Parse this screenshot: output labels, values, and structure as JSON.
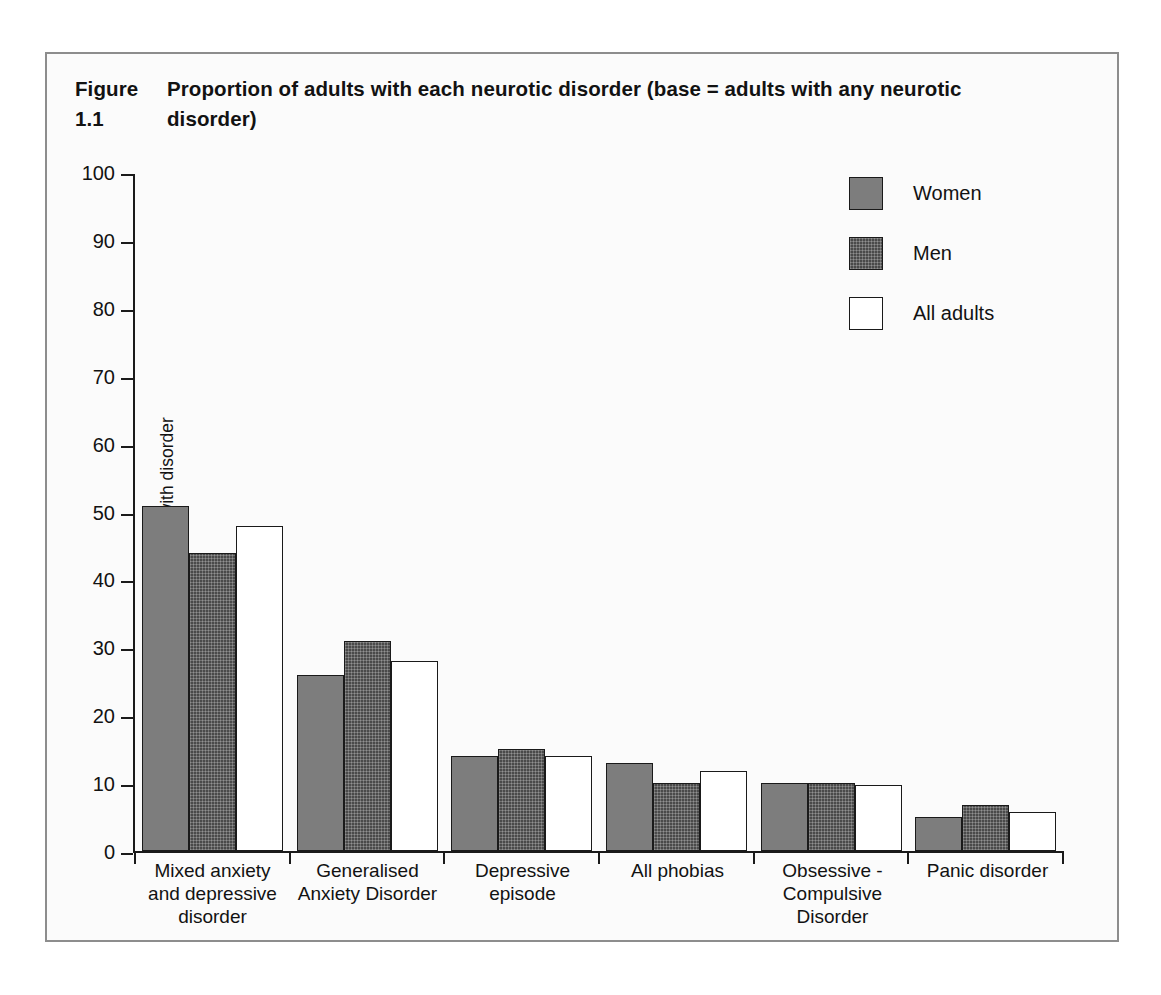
{
  "figure": {
    "number": "Figure 1.1",
    "caption": "Proportion of adults with each neurotic disorder (base = adults with any neurotic disorder)"
  },
  "legend": {
    "position": "top-right",
    "entries": [
      {
        "label": "Women",
        "swatch": "medium-grey-fill",
        "color": "#7d7d7d"
      },
      {
        "label": "Men",
        "swatch": "dark-grey-dotted-fill",
        "color": "#4a4a4a"
      },
      {
        "label": "All adults",
        "swatch": "white-fill",
        "color": "#ffffff"
      }
    ]
  },
  "axes": {
    "y_title": "Percentage with disorder",
    "y_ticks": [
      "100",
      "90",
      "80",
      "70",
      "60",
      "50",
      "40",
      "30",
      "20",
      "10",
      "0"
    ],
    "x_title": ""
  },
  "chart_data": {
    "type": "bar",
    "xlabel": "",
    "ylabel": "Percentage with disorder",
    "ylim": [
      0,
      100
    ],
    "ytick_step": 10,
    "grid": false,
    "legend_position": "top-right",
    "categories": [
      "Mixed anxiety and depressive disorder",
      "Generalised Anxiety Disorder",
      "Depressive episode",
      "All phobias",
      "Obsessive - Compulsive Disorder",
      "Panic disorder"
    ],
    "category_lines": [
      [
        "Mixed anxiety",
        "and depressive",
        "disorder"
      ],
      [
        "Generalised",
        "Anxiety Disorder"
      ],
      [
        "Depressive",
        "episode"
      ],
      [
        "All phobias"
      ],
      [
        "Obsessive -",
        "Compulsive",
        "Disorder"
      ],
      [
        "Panic disorder"
      ]
    ],
    "series": [
      {
        "name": "Women",
        "color": "#7d7d7d",
        "values": [
          51,
          26,
          14,
          13,
          10,
          5
        ]
      },
      {
        "name": "Men",
        "color": "#4a4a4a",
        "values": [
          44,
          31,
          15,
          10,
          10,
          6.8
        ]
      },
      {
        "name": "All adults",
        "color": "#ffffff",
        "values": [
          48,
          28,
          14,
          11.8,
          9.8,
          5.8
        ]
      }
    ]
  }
}
